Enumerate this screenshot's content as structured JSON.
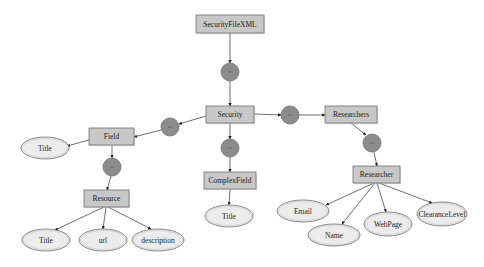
{
  "diagram": {
    "colors": {
      "background": "#ffffff",
      "box_fill": "#c8c8c8",
      "box_stroke": "#6e6e6e",
      "ellipse_fill": "#ececec",
      "ellipse_stroke": "#6e6e6e",
      "compositor_fill": "#8c8c8c",
      "compositor_stroke": "#707070",
      "edge": "#4a4a4a"
    },
    "nodes": [
      {
        "id": "securityfilexml",
        "type": "element",
        "label": "SecurityFileXML",
        "x": 196,
        "y": 15,
        "w": 68,
        "h": 18
      },
      {
        "id": "seq1",
        "type": "compositor",
        "label": "sequence",
        "cx": 230,
        "cy": 72,
        "r": 9
      },
      {
        "id": "security",
        "type": "element",
        "label": "Security",
        "x": 206,
        "y": 106,
        "w": 48,
        "h": 17
      },
      {
        "id": "seq2",
        "type": "compositor",
        "label": "sequence",
        "cx": 170,
        "cy": 127,
        "r": 9
      },
      {
        "id": "field",
        "type": "element",
        "label": "Field",
        "x": 89,
        "y": 128,
        "w": 45,
        "h": 17
      },
      {
        "id": "title1",
        "type": "attribute",
        "label": "Title",
        "cx": 45,
        "cy": 148,
        "rx": 24,
        "ry": 11
      },
      {
        "id": "seq3",
        "type": "compositor",
        "label": "sequence",
        "cx": 112,
        "cy": 167,
        "r": 9
      },
      {
        "id": "resource",
        "type": "element",
        "label": "Resource",
        "x": 84,
        "y": 190,
        "w": 45,
        "h": 17
      },
      {
        "id": "title2",
        "type": "attribute",
        "label": "Title",
        "cx": 46,
        "cy": 240,
        "rx": 24,
        "ry": 11
      },
      {
        "id": "url",
        "type": "attribute",
        "label": "url",
        "cx": 103,
        "cy": 240,
        "rx": 24,
        "ry": 11
      },
      {
        "id": "description",
        "type": "attribute",
        "label": "description",
        "cx": 158,
        "cy": 240,
        "rx": 26,
        "ry": 11
      },
      {
        "id": "seq4",
        "type": "compositor",
        "label": "sequence",
        "cx": 230,
        "cy": 148,
        "r": 9
      },
      {
        "id": "complexfield",
        "type": "element",
        "label": "ComplexField",
        "x": 204,
        "y": 172,
        "w": 52,
        "h": 17
      },
      {
        "id": "title3",
        "type": "attribute",
        "label": "Title",
        "cx": 229,
        "cy": 216,
        "rx": 24,
        "ry": 11
      },
      {
        "id": "seq5",
        "type": "compositor",
        "label": "sequence",
        "cx": 290,
        "cy": 115,
        "r": 9
      },
      {
        "id": "researchers",
        "type": "element",
        "label": "Researchers",
        "x": 325,
        "y": 106,
        "w": 52,
        "h": 17
      },
      {
        "id": "seq6",
        "type": "compositor",
        "label": "sequence",
        "cx": 372,
        "cy": 143,
        "r": 9
      },
      {
        "id": "researcher",
        "type": "element",
        "label": "Researcher",
        "x": 353,
        "y": 166,
        "w": 47,
        "h": 17
      },
      {
        "id": "email",
        "type": "attribute",
        "label": "Email",
        "cx": 303,
        "cy": 211,
        "rx": 26,
        "ry": 11
      },
      {
        "id": "name",
        "type": "attribute",
        "label": "Name",
        "cx": 334,
        "cy": 235,
        "rx": 26,
        "ry": 11
      },
      {
        "id": "webpage",
        "type": "attribute",
        "label": "WebPage",
        "cx": 388,
        "cy": 224,
        "rx": 24,
        "ry": 12
      },
      {
        "id": "clearancelevel",
        "type": "attribute",
        "label": "ClearanceLevel",
        "cx": 442,
        "cy": 214,
        "rx": 25,
        "ry": 12
      }
    ],
    "edges": [
      {
        "from": "securityfilexml",
        "to": "seq1",
        "x1": 230,
        "y1": 33,
        "x2": 230,
        "y2": 63
      },
      {
        "from": "seq1",
        "to": "security",
        "x1": 230,
        "y1": 81,
        "x2": 230,
        "y2": 106
      },
      {
        "from": "security",
        "to": "seq2",
        "x1": 206,
        "y1": 116,
        "x2": 179,
        "y2": 124
      },
      {
        "from": "seq2",
        "to": "field",
        "x1": 161,
        "y1": 130,
        "x2": 134,
        "y2": 137
      },
      {
        "from": "field",
        "to": "title1",
        "x1": 89,
        "y1": 140,
        "x2": 67,
        "y2": 146
      },
      {
        "from": "field",
        "to": "seq3",
        "x1": 112,
        "y1": 145,
        "x2": 112,
        "y2": 158
      },
      {
        "from": "seq3",
        "to": "resource",
        "x1": 111,
        "y1": 176,
        "x2": 107,
        "y2": 190
      },
      {
        "from": "resource",
        "to": "title2",
        "x1": 104,
        "y1": 207,
        "x2": 55,
        "y2": 230
      },
      {
        "from": "resource",
        "to": "url",
        "x1": 106,
        "y1": 207,
        "x2": 103,
        "y2": 229
      },
      {
        "from": "resource",
        "to": "description",
        "x1": 108,
        "y1": 207,
        "x2": 151,
        "y2": 229
      },
      {
        "from": "security",
        "to": "seq4",
        "x1": 230,
        "y1": 123,
        "x2": 230,
        "y2": 139
      },
      {
        "from": "seq4",
        "to": "complexfield",
        "x1": 230,
        "y1": 157,
        "x2": 230,
        "y2": 172
      },
      {
        "from": "complexfield",
        "to": "title3",
        "x1": 230,
        "y1": 189,
        "x2": 229,
        "y2": 205
      },
      {
        "from": "security",
        "to": "seq5",
        "x1": 254,
        "y1": 114,
        "x2": 281,
        "y2": 115
      },
      {
        "from": "seq5",
        "to": "researchers",
        "x1": 299,
        "y1": 115,
        "x2": 325,
        "y2": 115
      },
      {
        "from": "researchers",
        "to": "seq6",
        "x1": 351,
        "y1": 123,
        "x2": 366,
        "y2": 135
      },
      {
        "from": "seq6",
        "to": "researcher",
        "x1": 374,
        "y1": 152,
        "x2": 377,
        "y2": 166
      },
      {
        "from": "researcher",
        "to": "email",
        "x1": 374,
        "y1": 183,
        "x2": 326,
        "y2": 205
      },
      {
        "from": "researcher",
        "to": "name",
        "x1": 375,
        "y1": 183,
        "x2": 342,
        "y2": 224
      },
      {
        "from": "researcher",
        "to": "webpage",
        "x1": 377,
        "y1": 183,
        "x2": 386,
        "y2": 212
      },
      {
        "from": "researcher",
        "to": "clearancelevel",
        "x1": 379,
        "y1": 183,
        "x2": 432,
        "y2": 203
      }
    ]
  }
}
